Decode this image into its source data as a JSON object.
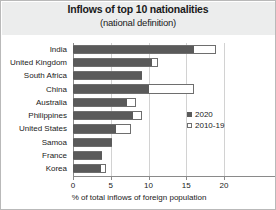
{
  "chart_data": {
    "type": "bar",
    "orientation": "horizontal",
    "title": "Inflows of top 10 nationalities",
    "subtitle": "(national definition)",
    "xlabel": "% of total inflows of foreign population",
    "ylabel": "",
    "xlim": [
      0,
      20
    ],
    "xticks": [
      0,
      5,
      10,
      15,
      20
    ],
    "xtick_labels": [
      "0",
      "5",
      "10",
      "15",
      "20"
    ],
    "grid": true,
    "legend_position": "center-right",
    "categories": [
      "India",
      "United Kingdom",
      "South Africa",
      "China",
      "Australia",
      "Philippines",
      "United States",
      "Samoa",
      "France",
      "Korea"
    ],
    "series": [
      {
        "name": "2020",
        "style": "filled",
        "color": "#5a5a5a",
        "values": [
          16.0,
          10.4,
          9.1,
          10.0,
          7.1,
          7.9,
          5.7,
          5.2,
          3.9,
          3.7
        ]
      },
      {
        "name": "2010-19",
        "style": "hollow",
        "color": "#ffffff",
        "values": [
          18.9,
          11.2,
          9.1,
          16.0,
          8.3,
          9.1,
          7.7,
          5.2,
          3.9,
          4.4
        ]
      }
    ]
  },
  "legend": {
    "items": [
      {
        "label": "2020"
      },
      {
        "label": "2010-19"
      }
    ]
  },
  "colors": {
    "series_2020": "#5a5a5a",
    "series_2010_19": "#ffffff",
    "title_band": "#eceded",
    "frame": "#b9b9b9",
    "grid": "#d2d2d2"
  }
}
